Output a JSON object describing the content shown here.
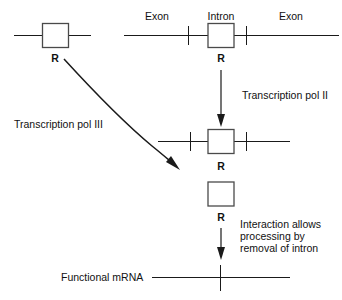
{
  "diagram": {
    "background_color": "#ffffff",
    "line_color": "#1a1a1a",
    "box_fill": "#ffffff",
    "box_stroke": "#4a4a4a"
  },
  "labels": {
    "exon_left": "Exon",
    "intron": "Intron",
    "exon_right": "Exon",
    "r_top_left": "R",
    "r_top_right": "R",
    "r_middle": "R",
    "r_box_above": "R",
    "r_box_below": "R",
    "transcription_pol_ii": "Transcription pol II",
    "transcription_pol_iii": "Transcription pol III",
    "interaction_line1": "Interaction allows",
    "interaction_line2": "processing by",
    "interaction_line3": "removal of intron",
    "functional_mrna": "Functional mRNA"
  }
}
